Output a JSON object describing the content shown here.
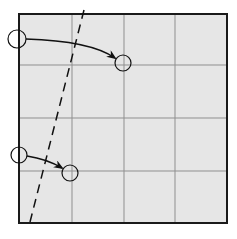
{
  "diagram": {
    "colors": {
      "paper": "#e6e6e6",
      "border": "#1a1a1a",
      "grid": "#8f8f8f",
      "ink": "#111111"
    },
    "square": {
      "x": 19,
      "y": 14,
      "width": 208,
      "height": 209
    },
    "grid_lines": {
      "vertical_x": [
        72,
        124,
        175
      ],
      "horizontal_y": [
        65,
        118,
        171
      ]
    },
    "fold_line": {
      "x1": 84,
      "y1": 10,
      "x2": 30,
      "y2": 222,
      "style": "dashed"
    },
    "markers": [
      {
        "id": "start-top",
        "cx": 17,
        "cy": 39,
        "r": 9
      },
      {
        "id": "end-top",
        "cx": 123,
        "cy": 63,
        "r": 8
      },
      {
        "id": "start-bottom",
        "cx": 19,
        "cy": 155,
        "r": 8
      },
      {
        "id": "end-bottom",
        "cx": 70,
        "cy": 173,
        "r": 8
      }
    ],
    "arrows": [
      {
        "id": "arrow-top",
        "path": "M26,39 C60,40 95,44 115,58"
      },
      {
        "id": "arrow-bottom",
        "path": "M27,156 C40,158 52,162 62,168"
      }
    ]
  }
}
